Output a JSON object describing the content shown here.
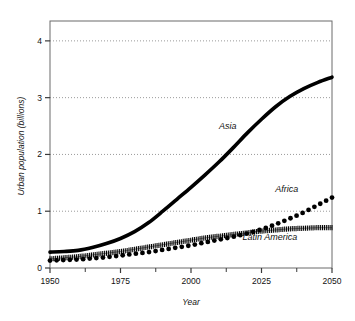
{
  "chart_data": {
    "type": "line",
    "title": "",
    "xlabel": "Year",
    "ylabel": "Urban population (billions)",
    "xlim": [
      1950,
      2050
    ],
    "ylim": [
      0,
      4.35
    ],
    "xticks": [
      1950,
      1975,
      2000,
      2025,
      2050
    ],
    "xtick_labels": [
      "1950",
      "1975",
      "2000",
      "2025",
      "2050"
    ],
    "xminorticks": [
      1962.5,
      1987.5,
      2012.5,
      2037.5
    ],
    "yticks": [
      0,
      1,
      2,
      3,
      4
    ],
    "ytick_labels": [
      "0",
      "1",
      "2",
      "3",
      "4"
    ],
    "grid": "horizontal-dotted",
    "legend": "inline-annotations",
    "x": [
      1950,
      1955,
      1960,
      1965,
      1970,
      1975,
      1980,
      1985,
      1990,
      1995,
      2000,
      2005,
      2010,
      2015,
      2020,
      2025,
      2030,
      2035,
      2040,
      2045,
      2050
    ],
    "series": [
      {
        "name": "Asia",
        "style": "thick-solid-line",
        "color": "#000000",
        "values": [
          0.28,
          0.29,
          0.31,
          0.36,
          0.43,
          0.52,
          0.64,
          0.8,
          1.0,
          1.21,
          1.42,
          1.64,
          1.87,
          2.12,
          2.38,
          2.62,
          2.84,
          3.02,
          3.16,
          3.27,
          3.36
        ]
      },
      {
        "name": "Africa",
        "style": "round-dot-markers",
        "color": "#000000",
        "values": [
          0.13,
          0.14,
          0.15,
          0.17,
          0.19,
          0.22,
          0.25,
          0.28,
          0.32,
          0.36,
          0.4,
          0.45,
          0.5,
          0.55,
          0.61,
          0.68,
          0.77,
          0.87,
          0.98,
          1.11,
          1.24
        ]
      },
      {
        "name": "Latin America",
        "style": "hatched-thick-line",
        "color": "#000000",
        "values": [
          0.16,
          0.18,
          0.2,
          0.23,
          0.26,
          0.29,
          0.33,
          0.37,
          0.41,
          0.45,
          0.49,
          0.53,
          0.56,
          0.59,
          0.62,
          0.65,
          0.67,
          0.69,
          0.7,
          0.71,
          0.71
        ]
      }
    ],
    "annotations": [
      {
        "text": "Asia",
        "x": 2013,
        "y": 2.45
      },
      {
        "text": "Africa",
        "x": 2034,
        "y": 1.33
      },
      {
        "text": "Latin America",
        "x": 2028,
        "y": 0.5
      }
    ]
  },
  "axes": {
    "y_axis_title": "Urban population (billions)",
    "x_axis_title": "Year"
  }
}
